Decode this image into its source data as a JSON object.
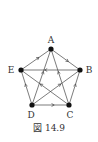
{
  "figure": {
    "caption": "図 14.9",
    "vertices": [
      {
        "id": "A",
        "label": "A",
        "x": 51,
        "y": 49,
        "lx": 51,
        "ly": 40
      },
      {
        "id": "B",
        "label": "B",
        "x": 80,
        "y": 70,
        "lx": 89,
        "ly": 70
      },
      {
        "id": "C",
        "label": "C",
        "x": 69,
        "y": 105,
        "lx": 70,
        "ly": 115
      },
      {
        "id": "D",
        "label": "D",
        "x": 32,
        "y": 105,
        "lx": 31,
        "ly": 115
      },
      {
        "id": "E",
        "label": "E",
        "x": 21,
        "y": 70,
        "lx": 11,
        "ly": 70
      }
    ],
    "edges": [
      {
        "from": "A",
        "to": "B"
      },
      {
        "from": "E",
        "to": "A"
      },
      {
        "from": "B",
        "to": "E"
      },
      {
        "from": "C",
        "to": "E"
      },
      {
        "from": "D",
        "to": "E"
      },
      {
        "from": "D",
        "to": "A"
      },
      {
        "from": "D",
        "to": "B"
      },
      {
        "from": "D",
        "to": "C"
      },
      {
        "from": "C",
        "to": "A"
      },
      {
        "from": "C",
        "to": "B"
      }
    ],
    "colors": {
      "line": "#444444",
      "vertex": "#111111",
      "background": "#ffffff"
    }
  }
}
